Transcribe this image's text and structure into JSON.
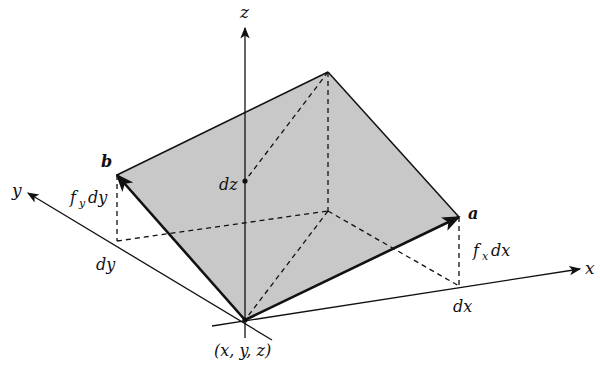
{
  "diagram": {
    "type": "3d-tangent-plane-vectors",
    "fill_color": "#c8c8c8",
    "stroke_color": "#111111",
    "labels": {
      "z_axis": "z",
      "y_axis": "y",
      "x_axis": "x",
      "vector_a": "a",
      "vector_b": "b",
      "dz": "dz",
      "dx": "dx",
      "dy": "dy",
      "fx_dx_f": "f",
      "fx_dx_sub": "x",
      "fx_dx_rest": "dx",
      "fy_dy_f": "f",
      "fy_dy_sub": "y",
      "fy_dy_rest": "dy",
      "origin": "(x, y, z)"
    }
  }
}
